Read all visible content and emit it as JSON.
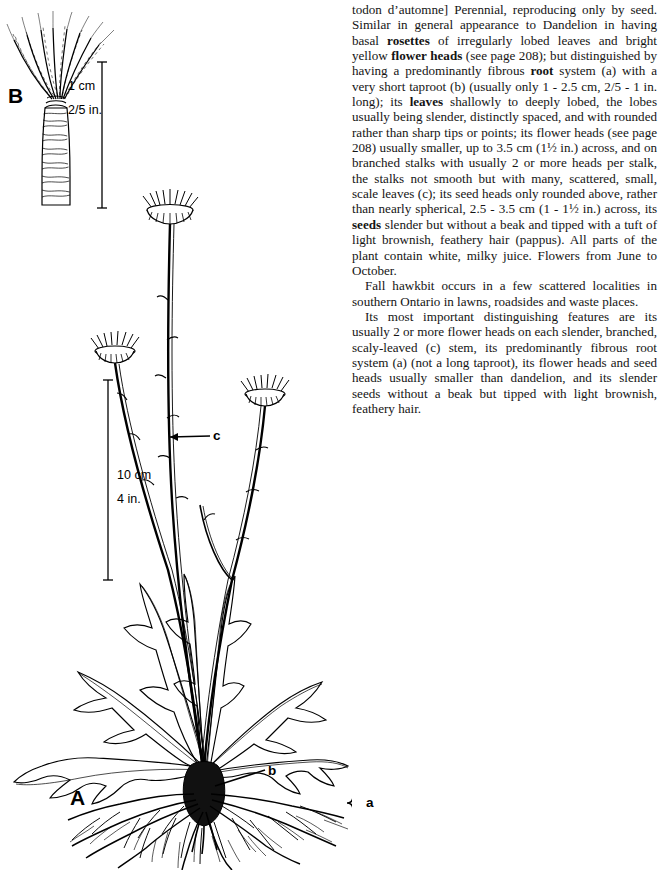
{
  "page": {
    "type": "botanical-field-guide-page",
    "ink_color": "#000000",
    "background_color": "#ffffff"
  },
  "illustration": {
    "figures": [
      {
        "id": "A",
        "label": "A",
        "caption_meaning": "whole plant with rosette, branched flowering stalks and fibrous root system"
      },
      {
        "id": "B",
        "label": "B",
        "caption_meaning": "enlarged seed with feathery pappus hairs"
      }
    ],
    "callouts": [
      {
        "label": "a",
        "meaning": "predominantly fibrous root system"
      },
      {
        "label": "b",
        "meaning": "very short taproot"
      },
      {
        "label": "c",
        "meaning": "small scattered scale leaves on the stalk"
      }
    ],
    "scales": [
      {
        "for": "B",
        "metric": "1 cm",
        "imperial": "2/5 in."
      },
      {
        "for": "A",
        "metric": "10 cm",
        "imperial": "4 in."
      }
    ]
  },
  "text": {
    "paragraphs": [
      {
        "indent": false,
        "runs": [
          {
            "t": "todon d’automne] Perennial, reproducing only by seed. Similar in general appearance to Dandelion in having basal "
          },
          {
            "t": "rosettes",
            "b": true
          },
          {
            "t": " of irregularly lobed leaves and bright yellow "
          },
          {
            "t": "flower heads",
            "b": true
          },
          {
            "t": " (see page 208); but distinguished by having a predominantly fibrous "
          },
          {
            "t": "root",
            "b": true
          },
          {
            "t": " system (a) with a very short taproot (b) (usually only 1 - 2.5 cm, 2/5 - 1 in. long); its "
          },
          {
            "t": "leaves",
            "b": true
          },
          {
            "t": " shallowly to deeply lobed, the lobes usually being slender, distinctly spaced, and with rounded rather than sharp tips or points; its flower heads (see page 208) usually smaller, up to 3.5 cm (1½ in.) across, and on branched stalks with usually 2 or more heads per stalk, the stalks not smooth but with many, scattered, small, scale leaves (c); its seed heads only rounded above, rather than nearly spherical, 2.5 - 3.5 cm (1 - 1½ in.) across, its "
          },
          {
            "t": "seeds",
            "b": true
          },
          {
            "t": " slender but without a beak and tipped with a tuft of light brownish, feathery hair (pappus). All parts of the plant contain white, milky juice. Flowers from June to October."
          }
        ]
      },
      {
        "indent": true,
        "runs": [
          {
            "t": "Fall hawkbit occurs in a few scattered localities in southern Ontario in lawns, roadsides and waste places."
          }
        ]
      },
      {
        "indent": true,
        "runs": [
          {
            "t": "Its most important distinguishing features are its usually 2 or more flower heads on each slender, branched, scaly-leaved (c) stem, its predominantly fibrous root system (a) (not a long taproot), its flower heads and seed heads usually smaller than dandelion, and its slender seeds without a beak but tipped with light brownish, feathery hair."
          }
        ]
      }
    ]
  }
}
